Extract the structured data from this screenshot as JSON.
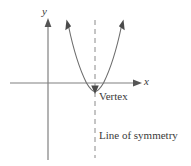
{
  "figure": {
    "kind": "parabola-diagram",
    "background_color": "#ffffff",
    "stroke_color": "#808080",
    "text_color": "#3a3a3a"
  },
  "axes": {
    "x_label": "x",
    "y_label": "y",
    "x_axis": {
      "x1": 10,
      "y1": 83,
      "x2": 142,
      "y2": 83,
      "arrow": "right"
    },
    "y_axis": {
      "x1": 48,
      "y1": 160,
      "x2": 48,
      "y2": 18,
      "arrow": "up"
    }
  },
  "curve": {
    "name": "parabola",
    "vertex": {
      "x": 95,
      "y": 90
    },
    "left_arm_tip": {
      "x": 66,
      "y": 21
    },
    "right_arm_tip": {
      "x": 123,
      "y": 21
    },
    "arrows": "both-ends-up"
  },
  "symmetry_line": {
    "x": 95,
    "y_top": 20,
    "y_bottom": 158,
    "style": "dashed"
  },
  "annotations": {
    "vertex_label": "Vertex",
    "symmetry_label": "Line of symmetry",
    "vertex_marker": "down-arrowhead"
  }
}
